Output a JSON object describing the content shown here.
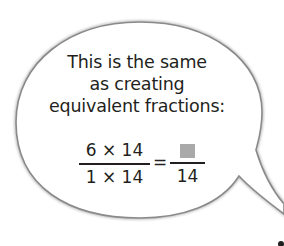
{
  "speech_bubble": {
    "lines": [
      "This is the same",
      "as creating",
      "equivalent fractions:"
    ],
    "equation": {
      "left_numerator": "6 × 14",
      "left_denominator": "1 × 14",
      "equals": "=",
      "right_numerator_placeholder": "answer-box",
      "right_denominator": "14"
    },
    "colors": {
      "outline": "#8a8a8a",
      "answer_box": "#a9a9a9",
      "text": "#231f20"
    }
  }
}
